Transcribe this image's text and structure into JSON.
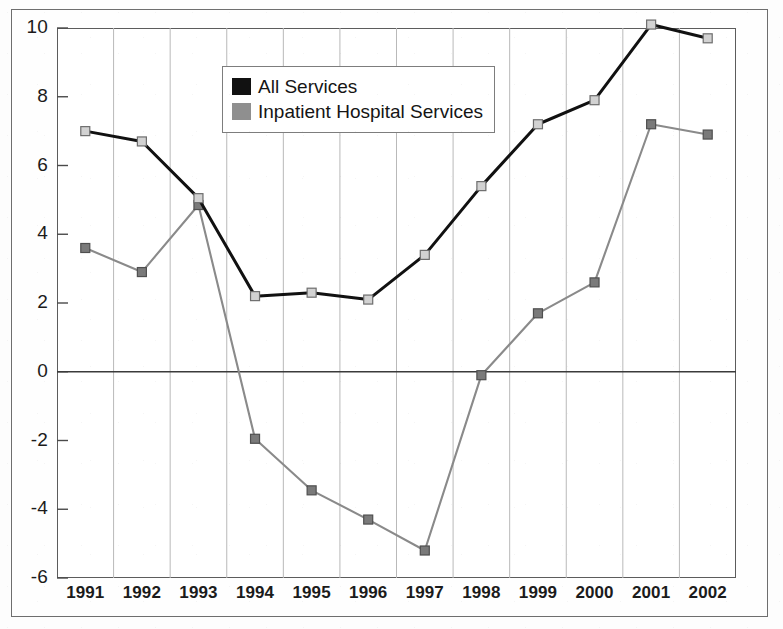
{
  "chart_data": {
    "type": "line",
    "title": "",
    "subtitle": "",
    "xlabel": "",
    "ylabel": "",
    "categories": [
      "1991",
      "1992",
      "1993",
      "1994",
      "1995",
      "1996",
      "1997",
      "1998",
      "1999",
      "2000",
      "2001",
      "2002"
    ],
    "ylim": [
      -6,
      10
    ],
    "yticks": [
      10,
      8,
      6,
      4,
      2,
      0,
      -2,
      -4,
      -6
    ],
    "ytick_labels": [
      "10",
      "8",
      "6",
      "4",
      "2",
      "0",
      "-2",
      "-4",
      "-6"
    ],
    "grid": "vertical",
    "legend_position": "top-center-left",
    "zero_line": true,
    "series": [
      {
        "name": "All Services",
        "color": "#111111",
        "marker": "square-light",
        "values": [
          7.0,
          6.7,
          5.05,
          2.2,
          2.3,
          2.1,
          3.4,
          5.4,
          7.2,
          7.9,
          10.1,
          9.7
        ]
      },
      {
        "name": "Inpatient Hospital Services",
        "color": "#8a8a8a",
        "marker": "square-dark",
        "values": [
          3.6,
          2.9,
          4.85,
          -1.95,
          -3.45,
          -4.3,
          -5.2,
          -0.1,
          1.7,
          2.6,
          7.2,
          6.9
        ]
      }
    ]
  },
  "legend": {
    "entries": [
      {
        "label": "All Services",
        "color": "#111111"
      },
      {
        "label": "Inpatient Hospital Services",
        "color": "#8a8a8a"
      }
    ]
  }
}
